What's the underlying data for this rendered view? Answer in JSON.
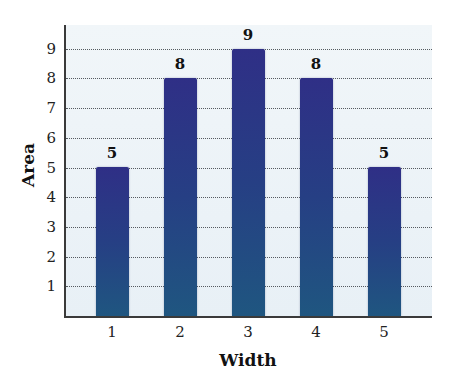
{
  "chart_data": {
    "type": "bar",
    "title": "",
    "xlabel": "Width",
    "ylabel": "Area",
    "categories": [
      "1",
      "2",
      "3",
      "4",
      "5"
    ],
    "values": [
      5,
      8,
      9,
      8,
      5
    ],
    "data_labels": [
      "5",
      "8",
      "9",
      "8",
      "5"
    ],
    "y_ticks": [
      "1",
      "2",
      "3",
      "4",
      "5",
      "6",
      "7",
      "8",
      "9"
    ],
    "ylim": [
      0,
      10
    ],
    "grid": {
      "horizontal": true,
      "style": "dotted"
    },
    "legend": null,
    "colors": {
      "bar_top": "#2f2f86",
      "bar_mid": "#263f84",
      "bar_bottom": "#1f5680",
      "plot_background": "#eef4f8",
      "axis": "#3a3a3a",
      "gridline": "#555a60"
    }
  }
}
